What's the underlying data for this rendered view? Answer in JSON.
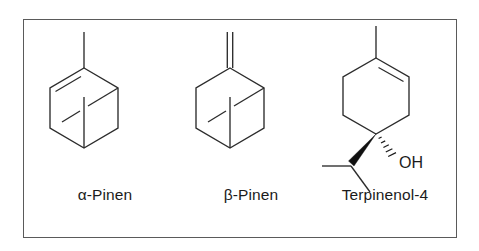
{
  "figure": {
    "background_color": "#ffffff",
    "border_color": "#5a5a5a",
    "bond_color": "#2c2c2c"
  },
  "structures": [
    {
      "id": "alpha-pinene",
      "label": "α-Pinen",
      "skeleton": "bicyclo[3.1.1]hept-2-ene",
      "features": {
        "ring": "six-membered ring drawn as hexagon",
        "double_bond": "endocyclic, upper-left edge",
        "substituent": "methyl group at top vertex (vertical line up)",
        "bridge": "one-carbon bridge shown as diagonal line plus vertical line to bottom vertex"
      },
      "atom_labels": []
    },
    {
      "id": "beta-pinene",
      "label": "β-Pinen",
      "skeleton": "6,6-dimethyl-2-methylenebicyclo[3.1.1]heptane",
      "features": {
        "ring": "six-membered ring drawn as hexagon",
        "double_bond": "exocyclic methylene at top vertex (two parallel vertical lines)",
        "substituent": "methylene (=CH2) at top vertex",
        "bridge": "one-carbon bridge shown as diagonal line plus vertical line to bottom vertex"
      },
      "atom_labels": []
    },
    {
      "id": "terpinenol-4",
      "label": "Terpinenol-4",
      "skeleton": "4-methyl-1-(propan-2-yl)cyclohex-3-en-1-ol",
      "features": {
        "ring": "cyclohexene drawn as hexagon with vertical top and bottom vertices",
        "double_bond": "endocyclic, upper-right edge",
        "substituent_top": "methyl group at top vertex (vertical line up)",
        "substituent_wedge": "bold wedge down-left to isopropyl group",
        "substituent_hash": "hashed wedge down-right to hydroxyl",
        "isopropyl": "CH with methyl to the left and methyl down-right"
      },
      "atom_labels": [
        "OH"
      ]
    }
  ],
  "atoms": {
    "hydroxyl": "OH"
  }
}
